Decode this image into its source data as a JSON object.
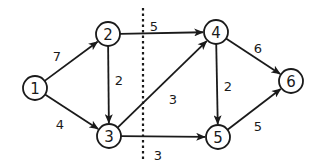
{
  "diagram": {
    "type": "directed-weighted-graph",
    "colors": {
      "stroke": "#1a1a1a",
      "background": "#ffffff",
      "node_fill": "#ffffff"
    },
    "nodes": [
      {
        "id": "1",
        "label": "1",
        "x": 35,
        "y": 88
      },
      {
        "id": "2",
        "label": "2",
        "x": 108,
        "y": 34
      },
      {
        "id": "3",
        "label": "3",
        "x": 109,
        "y": 136
      },
      {
        "id": "4",
        "label": "4",
        "x": 216,
        "y": 32
      },
      {
        "id": "5",
        "label": "5",
        "x": 218,
        "y": 137
      },
      {
        "id": "6",
        "label": "6",
        "x": 291,
        "y": 81
      }
    ],
    "edges": [
      {
        "from": "1",
        "to": "2",
        "weight": "7",
        "label_x": 57,
        "label_y": 56
      },
      {
        "from": "1",
        "to": "3",
        "weight": "4",
        "label_x": 60,
        "label_y": 124
      },
      {
        "from": "2",
        "to": "3",
        "weight": "2",
        "label_x": 119,
        "label_y": 80
      },
      {
        "from": "2",
        "to": "4",
        "weight": "5",
        "label_x": 154,
        "label_y": 26
      },
      {
        "from": "3",
        "to": "4",
        "weight": "3",
        "label_x": 173,
        "label_y": 99
      },
      {
        "from": "3",
        "to": "5",
        "weight": "3",
        "label_x": 158,
        "label_y": 155
      },
      {
        "from": "4",
        "to": "5",
        "weight": "2",
        "label_x": 228,
        "label_y": 86
      },
      {
        "from": "4",
        "to": "6",
        "weight": "6",
        "label_x": 258,
        "label_y": 48
      },
      {
        "from": "5",
        "to": "6",
        "weight": "5",
        "label_x": 258,
        "label_y": 126
      }
    ],
    "cut_line": {
      "x": 143,
      "y1": 8,
      "y2": 160,
      "style": "dotted"
    }
  }
}
